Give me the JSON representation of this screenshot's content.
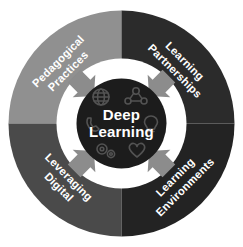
{
  "diagram": {
    "center": {
      "line1": "Deep",
      "line2": "Learning",
      "color": "#1c1c1c"
    },
    "quadrants": [
      {
        "id": "pedagogical-practices",
        "position": "top-left",
        "line1": "Pedagogical",
        "line2": "Practices",
        "color": "#909090",
        "text_color": "#ffffff",
        "rotation": -45
      },
      {
        "id": "learning-partnerships",
        "position": "top-right",
        "line1": "Learning",
        "line2": "Partnerships",
        "color": "#2b2b2b",
        "text_color": "#ffffff",
        "rotation": 45
      },
      {
        "id": "leveraging-digital",
        "position": "bottom-left",
        "line1": "Leveraging",
        "line2": "Digital",
        "color": "#4a4a4a",
        "text_color": "#ffffff",
        "rotation": 45
      },
      {
        "id": "learning-environments",
        "position": "bottom-right",
        "line1": "Learning",
        "line2": "Environments",
        "color": "#232323",
        "text_color": "#ffffff",
        "rotation": -45
      }
    ],
    "inner_ring": {
      "color": "#ffffff",
      "arrow_color": "#8c8c8c",
      "arrow_count": 4,
      "arrow_direction": "inward"
    },
    "center_icons": [
      {
        "name": "globe-icon",
        "position": "top-left"
      },
      {
        "name": "people-network-icon",
        "position": "top-right"
      },
      {
        "name": "phone-icon",
        "position": "left"
      },
      {
        "name": "lightbulb-icon",
        "position": "right"
      },
      {
        "name": "gears-icon",
        "position": "bottom-left"
      },
      {
        "name": "heart-icon",
        "position": "bottom-right"
      }
    ],
    "background_color": "#ffffff"
  }
}
